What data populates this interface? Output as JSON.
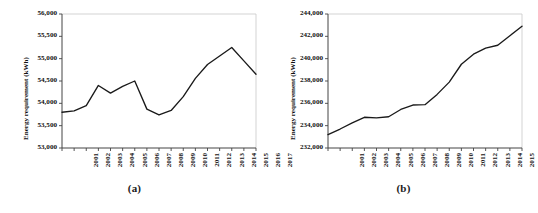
{
  "figure": {
    "panels": [
      {
        "caption": "(a)",
        "ylabel": "Energy requirement (kWh)",
        "ytick_labels": [
          "56,000",
          "55,500",
          "55,000",
          "54,500",
          "54,000",
          "53,500",
          "53,000"
        ],
        "xtick_labels": [
          "2001",
          "2002",
          "2003",
          "2004",
          "2005",
          "2006",
          "2007",
          "2008",
          "2009",
          "2010",
          "2011",
          "2012",
          "2013",
          "2014",
          "2015",
          "2016",
          "2017"
        ]
      },
      {
        "caption": "(b)",
        "ylabel": "Energy requirement (kWh)",
        "ytick_labels": [
          "244,000",
          "242,000",
          "240,000",
          "238,000",
          "236,000",
          "234,000",
          "232,000"
        ],
        "xtick_labels": [
          "2001",
          "2002",
          "2003",
          "2004",
          "2005",
          "2006",
          "2007",
          "2008",
          "2009",
          "2010",
          "2011",
          "2012",
          "2013",
          "2014",
          "2015",
          "2016",
          "2017"
        ]
      }
    ]
  },
  "chart_data": [
    {
      "type": "line",
      "title": "(a)",
      "xlabel": "",
      "ylabel": "Energy requirement (kWh)",
      "categories": [
        2001,
        2002,
        2003,
        2004,
        2005,
        2006,
        2007,
        2008,
        2009,
        2010,
        2011,
        2012,
        2013,
        2014,
        2015,
        2016,
        2017
      ],
      "values": [
        53800,
        53830,
        53950,
        54400,
        54230,
        54380,
        54500,
        53870,
        53740,
        53840,
        54150,
        54560,
        54870,
        55060,
        55250,
        54950,
        54650
      ],
      "ylim": [
        53000,
        56000
      ],
      "ytick_values": [
        53000,
        53500,
        54000,
        54500,
        55000,
        55500,
        56000
      ],
      "grid": false,
      "legend": "none",
      "line_color": "#1a1a1a"
    },
    {
      "type": "line",
      "title": "(b)",
      "xlabel": "",
      "ylabel": "Energy requirement (kWh)",
      "categories": [
        2001,
        2002,
        2003,
        2004,
        2005,
        2006,
        2007,
        2008,
        2009,
        2010,
        2011,
        2012,
        2013,
        2014,
        2015,
        2016,
        2017
      ],
      "values": [
        233200,
        233700,
        234250,
        234750,
        234700,
        234800,
        235450,
        235850,
        235880,
        236800,
        237900,
        239500,
        240400,
        240950,
        241200,
        242050,
        242900
      ],
      "ylim": [
        232000,
        244000
      ],
      "ytick_values": [
        232000,
        234000,
        236000,
        238000,
        240000,
        242000,
        244000
      ],
      "grid": false,
      "legend": "none",
      "line_color": "#1a1a1a"
    }
  ]
}
